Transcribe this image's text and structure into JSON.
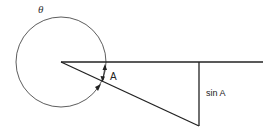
{
  "diagram": {
    "labels": {
      "theta": "θ",
      "angle": "A",
      "opposite_side": "sin A"
    },
    "colors": {
      "stroke": "#222222",
      "background": "#ffffff"
    },
    "elements": [
      {
        "type": "circle",
        "name": "theta-circle",
        "center": [
          61,
          62
        ],
        "radius": 45
      },
      {
        "type": "line",
        "name": "horizontal-ray",
        "from": [
          61,
          62
        ],
        "to": [
          263,
          62
        ]
      },
      {
        "type": "line",
        "name": "hypotenuse",
        "from": [
          61,
          62
        ],
        "to": [
          199,
          126
        ]
      },
      {
        "type": "line",
        "name": "vertical-side",
        "from": [
          199,
          62
        ],
        "to": [
          199,
          126
        ]
      },
      {
        "type": "arrow",
        "name": "angle-arc-arrows",
        "between": [
          "horizontal-ray",
          "hypotenuse"
        ]
      }
    ]
  }
}
